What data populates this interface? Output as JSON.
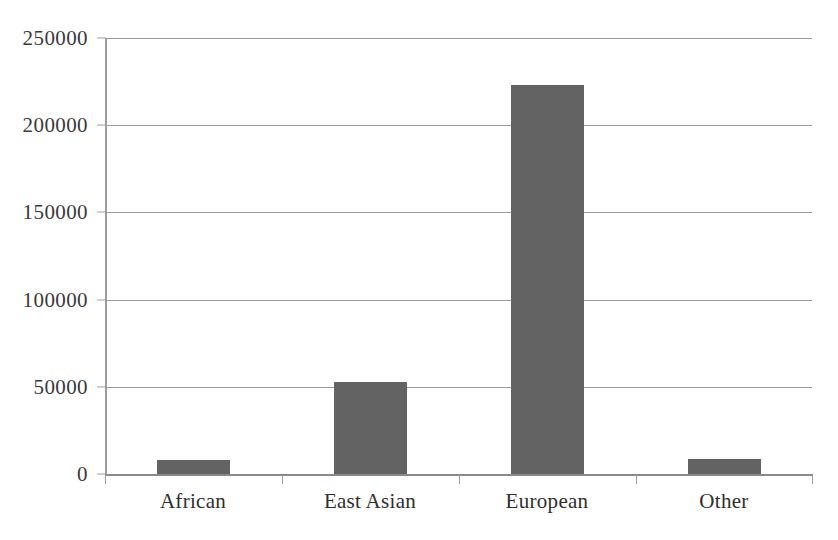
{
  "chart_data": {
    "type": "bar",
    "title": "",
    "subtitle": "",
    "xlabel": "",
    "ylabel": "",
    "categories": [
      "African",
      "East Asian",
      "European",
      "Other"
    ],
    "values": [
      8000,
      53000,
      223000,
      8500
    ],
    "series": [
      {
        "name": "Count",
        "values": [
          8000,
          53000,
          223000,
          8500
        ]
      }
    ],
    "ylim": [
      0,
      250000
    ],
    "ytick_labels": [
      "250000",
      "200000",
      "150000",
      "100000",
      "50000",
      "0"
    ],
    "ytick_values": [
      250000,
      200000,
      150000,
      100000,
      50000,
      0
    ],
    "grid": true,
    "grid_axis": "y",
    "legend": false,
    "legend_position": "none",
    "bar_color": "#636363",
    "grid_color": "#9b9b9b",
    "axis_color": "#8a8a8a",
    "text_color": "#2e2e2e",
    "background": "#ffffff",
    "annotations": []
  }
}
